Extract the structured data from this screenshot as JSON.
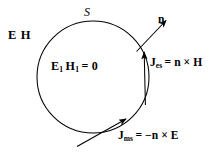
{
  "figure": {
    "kind": "surface-equivalence-diagram",
    "background_color": "#ffffff",
    "ink_color": "#000000",
    "surface": {
      "shape": "circle",
      "label": "S",
      "center_x": 93,
      "center_y": 77,
      "radius": 56,
      "stroke_width": 1
    },
    "labels": {
      "exterior_fields": "E H",
      "exterior_field_e": "E",
      "exterior_field_h": "H",
      "interior_fields": "E₁ H₁ = 0",
      "interior_field_e": "E",
      "interior_field_e_sub": "1",
      "interior_field_h": "H",
      "interior_field_h_sub": "1",
      "interior_equals_zero": "= 0",
      "normal_vector": "n",
      "electric_current_symbol": "J",
      "electric_current_sub": "es",
      "electric_current_rhs": "= n × H",
      "electric_current_full": "Jₑₛ = n × H",
      "magnetic_current_symbol": "J",
      "magnetic_current_sub": "ms",
      "magnetic_current_rhs": "= −n × E",
      "magnetic_current_full": "Jₘₛ = −n × E"
    },
    "arrows": [
      {
        "name": "normal-vector-arrow",
        "from_x": 136,
        "from_y": 51,
        "to_x": 169,
        "to_y": 17,
        "label": "n",
        "description": "outward unit normal at surface"
      },
      {
        "name": "electric-current-arrow",
        "from_x": 145,
        "from_y": 104,
        "to_x": 144,
        "to_y": 47,
        "label": "J es",
        "description": "equivalent electric surface current, tangential upward"
      },
      {
        "name": "magnetic-current-arrow",
        "from_x": 77,
        "from_y": 146,
        "to_x": 130,
        "to_y": 116,
        "label": "J ms",
        "description": "equivalent magnetic surface current, tangential"
      }
    ]
  }
}
